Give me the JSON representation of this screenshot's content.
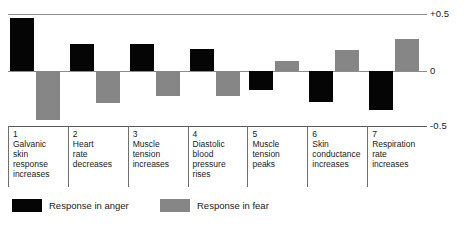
{
  "chart_data": {
    "type": "bar",
    "title": "",
    "xlabel": "",
    "ylabel": "",
    "ylim": [
      -0.5,
      0.5
    ],
    "grid": true,
    "legend_position": "bottom-left",
    "axis_ticks": [
      {
        "label": "+0.5",
        "value": 0.5
      },
      {
        "label": "0",
        "value": 0
      },
      {
        "label": "-0.5",
        "value": -0.5
      }
    ],
    "categories": [
      {
        "number": "1",
        "label": "Galvanic\nskin\nresponse\nincreases"
      },
      {
        "number": "2",
        "label": "Heart\nrate\ndecreases"
      },
      {
        "number": "3",
        "label": "Muscle\ntension\nincreases"
      },
      {
        "number": "4",
        "label": "Diastolic\nblood\npressure\nrises"
      },
      {
        "number": "5",
        "label": "Muscle\ntension\npeaks"
      },
      {
        "number": "6",
        "label": "Skin\nconductance\nincreases"
      },
      {
        "number": "7",
        "label": "Respiration\nrate\nincreases"
      }
    ],
    "series": [
      {
        "name": "Response in anger",
        "color": "#050505",
        "values": [
          0.47,
          0.24,
          0.24,
          0.2,
          -0.17,
          -0.28,
          -0.35
        ]
      },
      {
        "name": "Response in fear",
        "color": "#868686",
        "values": [
          -0.44,
          -0.29,
          -0.22,
          -0.22,
          0.09,
          0.19,
          0.29
        ]
      }
    ]
  },
  "legend": {
    "items": [
      {
        "label": "Response in anger",
        "color": "#050505"
      },
      {
        "label": "Response in fear",
        "color": "#868686"
      }
    ]
  }
}
